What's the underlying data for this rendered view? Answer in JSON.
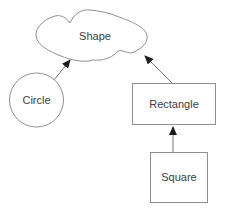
{
  "diagram": {
    "type": "inheritance-diagram",
    "nodes": {
      "shape": {
        "label": "Shape",
        "kind": "cloud"
      },
      "circle": {
        "label": "Circle",
        "kind": "ellipse"
      },
      "rectangle": {
        "label": "Rectangle",
        "kind": "rect"
      },
      "square": {
        "label": "Square",
        "kind": "rect"
      }
    },
    "edges": [
      {
        "from": "Circle",
        "to": "Shape",
        "style": "solid-arrowhead"
      },
      {
        "from": "Rectangle",
        "to": "Shape",
        "style": "solid-arrowhead"
      },
      {
        "from": "Square",
        "to": "Rectangle",
        "style": "solid-arrowhead"
      }
    ],
    "colors": {
      "background": "#ffffff",
      "outline": "#8f8f8f",
      "edge_line": "#787878",
      "arrowhead": "#1c1c1c",
      "text": "#3d3d3d"
    }
  }
}
